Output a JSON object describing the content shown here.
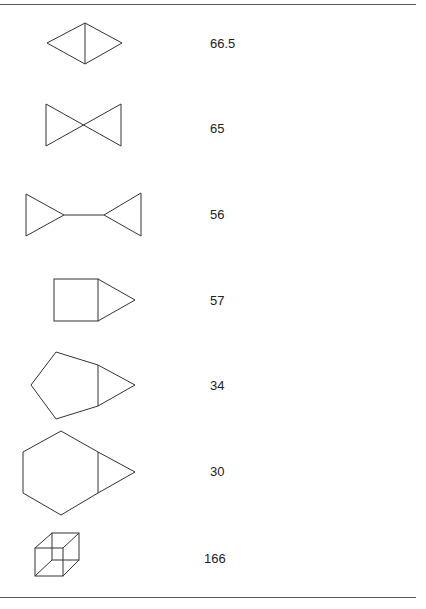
{
  "rows": [
    {
      "shape": "diamond-with-vertical-diagonal",
      "value": "66.5"
    },
    {
      "shape": "bowtie",
      "value": "65"
    },
    {
      "shape": "two-triangles-joined-by-line",
      "value": "56"
    },
    {
      "shape": "square-with-triangle",
      "value": "57"
    },
    {
      "shape": "pentagon-with-triangle",
      "value": "34"
    },
    {
      "shape": "hexagon-with-triangle",
      "value": "30"
    },
    {
      "shape": "wireframe-cube",
      "value": "166"
    }
  ]
}
